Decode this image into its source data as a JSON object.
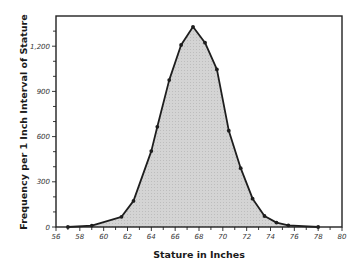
{
  "chart_data": {
    "type": "area",
    "title": "",
    "xlabel": "Stature in Inches",
    "ylabel": "Frequency per 1 Inch Interval of Stature",
    "xlim": [
      56,
      80
    ],
    "ylim": [
      0,
      1350
    ],
    "x_ticks": [
      56,
      58,
      60,
      62,
      64,
      66,
      68,
      70,
      72,
      74,
      76,
      78,
      80
    ],
    "y_ticks": [
      0,
      300,
      600,
      900,
      1200
    ],
    "y_tick_labels": [
      "0",
      "300",
      "600",
      "900",
      "1,200"
    ],
    "grid": false,
    "legend": null,
    "series": [
      {
        "name": "Frequency",
        "x": [
          57,
          59,
          61.5,
          62.5,
          64,
          64.5,
          65.5,
          66.5,
          67.5,
          68.5,
          69.5,
          70.5,
          71.5,
          72.5,
          73.5,
          74.5,
          75.5,
          78
        ],
        "values": [
          0,
          9,
          68,
          173,
          504,
          665,
          975,
          1208,
          1329,
          1223,
          1046,
          639,
          390,
          188,
          73,
          29,
          11,
          0
        ]
      }
    ],
    "style": {
      "line_color": "#1e1e1e",
      "fill_color": "#d4d4d4",
      "frame_color": "#222222"
    }
  }
}
